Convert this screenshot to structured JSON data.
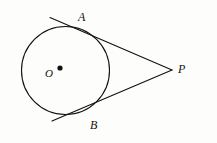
{
  "figure": {
    "background_color": "#fdfdfb",
    "stroke_color": "#111111",
    "labels": {
      "center": "O",
      "tangent_point_upper": "A",
      "tangent_point_lower": "B",
      "external_point": "P"
    },
    "geometry": {
      "circle": {
        "cx": 65.5,
        "cy": 70.5,
        "r": 44
      },
      "center_dot": {
        "cx": 60,
        "cy": 68,
        "r": 2.6
      },
      "external_point": {
        "x": 172,
        "y": 70
      },
      "tangent_point_upper": {
        "x": 95.5,
        "y": 33.5
      },
      "tangent_point_lower": {
        "x": 88.5,
        "y": 109.5
      },
      "upper_tangent_line": {
        "x1": 50,
        "y1": 17.5,
        "x2": 172,
        "y2": 70
      },
      "lower_tangent_line": {
        "x1": 52,
        "y1": 121,
        "x2": 172,
        "y2": 70
      },
      "stroke_width": 1.1
    }
  }
}
